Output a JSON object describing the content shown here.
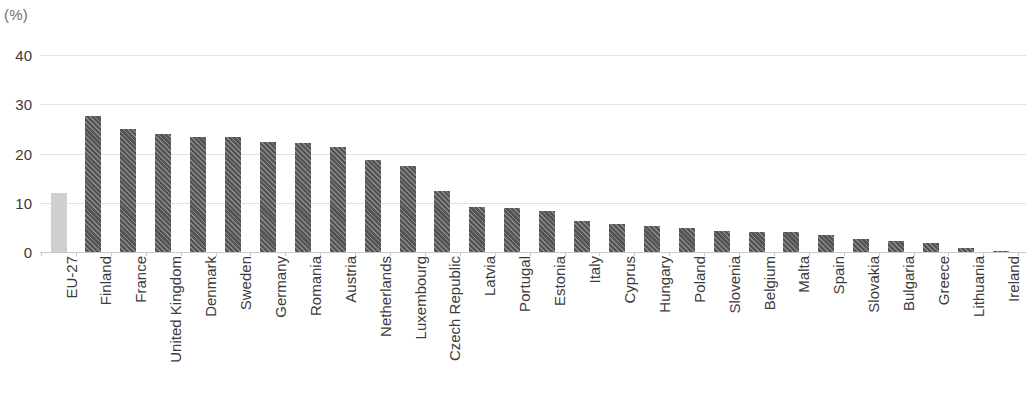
{
  "chart_data": {
    "type": "bar",
    "title": "",
    "subtitle": "",
    "unit_label": "(%)",
    "xlabel": "",
    "ylabel": "",
    "ylim": [
      0,
      40
    ],
    "yticks": [
      0,
      10,
      20,
      30,
      40
    ],
    "grid": true,
    "legend": null,
    "categories": [
      "EU-27",
      "Finland",
      "France",
      "United Kingdom",
      "Denmark",
      "Sweden",
      "Germany",
      "Romania",
      "Austria",
      "Netherlands",
      "Luxembourg",
      "Czech Republic",
      "Latvia",
      "Portugal",
      "Estonia",
      "Italy",
      "Cyprus",
      "Hungary",
      "Poland",
      "Slovenia",
      "Belgium",
      "Malta",
      "Spain",
      "Slovakia",
      "Bulgaria",
      "Greece",
      "Lithuania",
      "Ireland",
      "Norway"
    ],
    "values": [
      11.9,
      27.6,
      24.9,
      24.0,
      23.4,
      23.3,
      22.4,
      22.1,
      21.4,
      18.6,
      17.4,
      12.3,
      9.2,
      9.0,
      8.4,
      6.2,
      5.7,
      5.2,
      4.9,
      4.3,
      4.1,
      4.1,
      3.4,
      2.7,
      2.2,
      1.8,
      0.8,
      0.3,
      32.6
    ],
    "bar_styles": [
      "light-solid",
      "dark",
      "dark",
      "dark",
      "dark",
      "dark",
      "dark",
      "dark",
      "dark",
      "dark",
      "dark",
      "dark",
      "dark",
      "dark",
      "dark",
      "dark",
      "dark",
      "dark",
      "dark",
      "dark",
      "dark",
      "dark",
      "dark",
      "dark",
      "dark",
      "dark",
      "dark",
      "dark",
      "light-hatch"
    ],
    "colors": {
      "bar_dark": "#545454",
      "bar_light_solid": "#cfcfcf",
      "bar_light_hatch": "#c6c6c6",
      "gridline": "#e2e2e2",
      "axis": "#c8c8c8",
      "text": "#3b3b3b",
      "unit_text": "#6f6f6f"
    }
  }
}
